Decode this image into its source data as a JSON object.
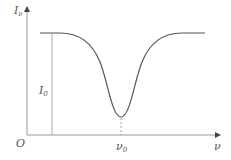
{
  "diagram": {
    "type": "absorption-line-profile",
    "y_axis_label": "I",
    "y_axis_subscript": "ν",
    "x_axis_label": "ν",
    "origin_label": "O",
    "continuum_label": "I",
    "continuum_subscript": "0",
    "center_label": "ν",
    "center_subscript": "0",
    "colors": {
      "axis": "#9a9a9a",
      "curve": "#555555",
      "label": "#555555"
    }
  }
}
